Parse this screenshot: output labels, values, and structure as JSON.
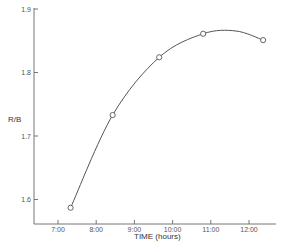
{
  "chart_data": {
    "type": "line",
    "title": "",
    "xlabel": "TIME (hours)",
    "ylabel": "R/B",
    "x_ticks": [
      "7:00",
      "8:00",
      "9:00",
      "10:00",
      "11:00",
      "12:00"
    ],
    "x_tick_values": [
      7,
      8,
      9,
      10,
      11,
      12
    ],
    "y_ticks": [
      "1.6",
      "1.7",
      "1.8",
      "1.9"
    ],
    "y_tick_values": [
      1.6,
      1.7,
      1.8,
      1.9
    ],
    "xlim": [
      6.35,
      12.6
    ],
    "ylim": [
      1.56,
      1.9
    ],
    "grid": false,
    "legend": null,
    "series": [
      {
        "name": "R/B",
        "marker": "open-circle",
        "line": "smooth-fit",
        "x": [
          7.33,
          8.43,
          9.65,
          10.8,
          12.37
        ],
        "y": [
          1.587,
          1.733,
          1.824,
          1.861,
          1.851
        ]
      }
    ]
  }
}
